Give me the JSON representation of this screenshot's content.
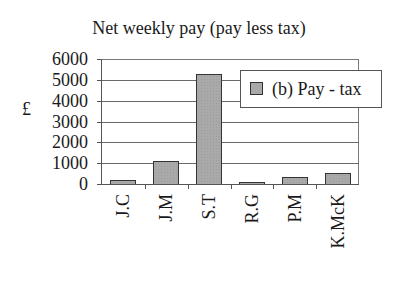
{
  "chart_data": {
    "type": "bar",
    "title": "Net weekly pay (pay less tax)",
    "xlabel": "",
    "ylabel": "£",
    "categories": [
      "J.C",
      "J.M",
      "S.T",
      "R.G",
      "P.M",
      "K.McK"
    ],
    "series": [
      {
        "name": "(b) Pay - tax",
        "values": [
          200,
          1100,
          5300,
          100,
          350,
          550
        ],
        "color": "#a9a9a9"
      }
    ],
    "ylim": [
      0,
      6000
    ],
    "yticks": [
      "0",
      "1000",
      "2000",
      "3000",
      "4000",
      "5000",
      "6000"
    ],
    "grid": true,
    "legend_position": "upper right (inside plot)",
    "x_tick_label_rotation": 90
  }
}
